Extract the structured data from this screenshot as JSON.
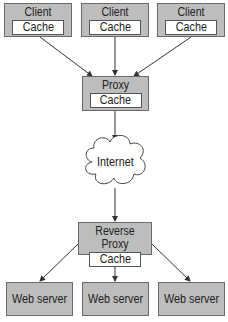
{
  "clients": [
    {
      "title": "Client",
      "cache": "Cache"
    },
    {
      "title": "Client",
      "cache": "Cache"
    },
    {
      "title": "Client",
      "cache": "Cache"
    }
  ],
  "proxy": {
    "title": "Proxy",
    "cache": "Cache"
  },
  "internet": {
    "label": "Internet"
  },
  "reverse_proxy": {
    "title": "Reverse Proxy",
    "cache": "Cache"
  },
  "web_servers": [
    {
      "label": "Web server"
    },
    {
      "label": "Web server"
    },
    {
      "label": "Web server"
    }
  ],
  "colors": {
    "box_fill": "#bdbdbd",
    "box_border": "#6a6a6a",
    "arrow": "#333333"
  }
}
